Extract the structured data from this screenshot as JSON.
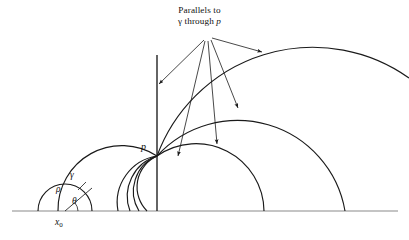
{
  "figure": {
    "domain": "Diagram",
    "kind": "hyperbolic-geometry-upper-half-plane",
    "width": 409,
    "height": 240,
    "background_color": "#ffffff",
    "ink_color": "#1a1a1a",
    "baseline_color": "#8a8a8a"
  },
  "labels": {
    "callout_line1": "Parallels to",
    "callout_line2_pre": "γ through ",
    "callout_line2_ital": "p",
    "point_p": "p",
    "gamma": "γ",
    "rho": "ρ",
    "theta": "θ",
    "x0_base": "x",
    "x0_sub": "0"
  },
  "geometry": {
    "baseline": {
      "x1": 12,
      "x2": 398,
      "y": 211
    },
    "point_p": {
      "x": 157,
      "y": 156
    },
    "callout_anchor": {
      "x": 206,
      "y": 38
    },
    "small_semicircle": {
      "center_x": 65,
      "center_y": 211,
      "radius": 27,
      "theta_degrees": 38,
      "radius_line_end_x": 86,
      "radius_line_end_y": 194,
      "gamma_tick_end_x": 92,
      "gamma_tick_end_y": 188,
      "angle_arc_radius": 13
    },
    "vertical_geodesic": {
      "x": 157,
      "y_top": 55,
      "y_bottom": 211
    },
    "gamma_curve_feet": [
      92,
      119
    ],
    "parallel_semicircles": [
      {
        "name": "arc-through-p-left-large",
        "cx": 122,
        "cy": 211,
        "r": 64
      },
      {
        "name": "arc-through-p-steep-1",
        "cx": 133,
        "cy": 211,
        "r": 57
      },
      {
        "name": "arc-through-p-steep-2",
        "cx": 141,
        "cy": 211,
        "r": 57
      },
      {
        "name": "arc-through-p-steep-3",
        "cx": 148,
        "cy": 211,
        "r": 56
      },
      {
        "name": "arc-through-p-right-small",
        "cx": 196,
        "cy": 211,
        "r": 68
      },
      {
        "name": "arc-through-p-right-medium",
        "cx": 236,
        "cy": 211,
        "r": 109
      },
      {
        "name": "arc-through-p-right-large",
        "cx": 281,
        "cy": 211,
        "r": 166
      }
    ],
    "callout_arrows": [
      {
        "name": "arrow-to-vertical-geodesic",
        "x2": 157,
        "y2": 85
      },
      {
        "name": "arrow-to-steep-arc",
        "x2": 177,
        "y2": 157
      },
      {
        "name": "arrow-to-small-right-arc",
        "x2": 216,
        "y2": 145
      },
      {
        "name": "arrow-to-medium-right-arc",
        "x2": 237,
        "y2": 109
      },
      {
        "name": "arrow-to-large-right-arc",
        "x2": 261,
        "y2": 52
      }
    ]
  }
}
